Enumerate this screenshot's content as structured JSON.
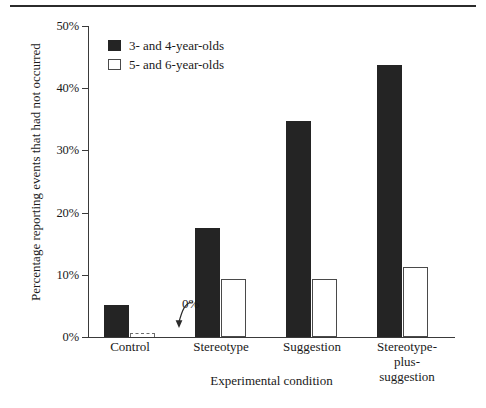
{
  "chart_data": {
    "type": "bar",
    "title": "",
    "xlabel": "Experimental condition",
    "ylabel": "Percentage reporting events that had not occurred",
    "categories": [
      "Control",
      "Stereotype",
      "Suggestion",
      "Stereotype-\nplus-suggestion"
    ],
    "ylim": [
      0,
      50
    ],
    "ytick_labels": [
      "0%",
      "10%",
      "20%",
      "30%",
      "40%",
      "50%"
    ],
    "ytick_values": [
      0,
      10,
      20,
      30,
      40,
      50
    ],
    "grid": false,
    "legend_position": "top-left-inside",
    "series": [
      {
        "name": "3- and 4-year-olds",
        "style": "filled",
        "color": "#242424",
        "values": [
          5.2,
          17.6,
          34.8,
          43.8
        ]
      },
      {
        "name": "5- and 6-year-olds",
        "style": "hollow",
        "color": "#ffffff",
        "values": [
          0,
          9.4,
          9.4,
          11.2
        ]
      }
    ],
    "annotations": [
      {
        "text": "0%",
        "target_series": "5- and 6-year-olds",
        "target_category": "Control",
        "note": "curved arrow pointing to zero-height dashed bar"
      }
    ]
  },
  "figure": {
    "top_rule": "horizontal-rule"
  }
}
